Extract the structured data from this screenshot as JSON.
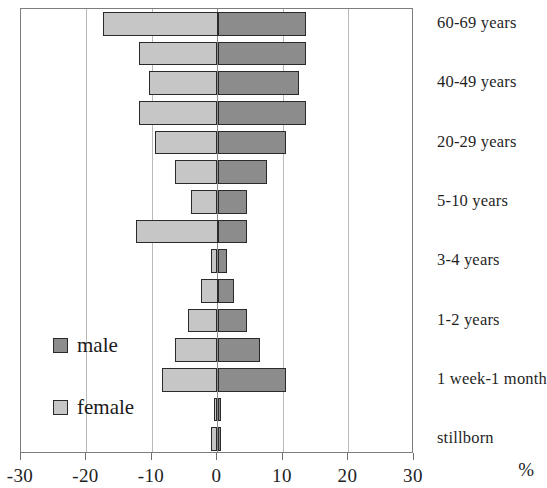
{
  "chart_data": {
    "type": "bar",
    "subtype": "population-pyramid",
    "title": "",
    "xlabel": "%",
    "ylabel": "",
    "xlim": [
      -30,
      30
    ],
    "xticks": [
      -30,
      -20,
      -10,
      0,
      10,
      20,
      30
    ],
    "xticklabels": [
      "-30",
      "-20",
      "-10",
      "0",
      "10",
      "20",
      "30"
    ],
    "grid": true,
    "legend_position": "left-inside",
    "categories": [
      "60-69 years",
      "",
      "40-49 years",
      "",
      "20-29 years",
      "",
      "5-10 years",
      "",
      "3-4 years",
      "",
      "1-2 years",
      "",
      "1 week-1 month",
      "",
      "stillborn"
    ],
    "series": [
      {
        "name": "female",
        "color": "#c6c6c6",
        "side": "left",
        "values": [
          -17.5,
          -12.0,
          -10.5,
          -12.0,
          -9.5,
          -6.5,
          -4.0,
          -12.5,
          -1.0,
          -2.5,
          -4.5,
          -6.5,
          -8.5,
          -0.5,
          -1.0
        ]
      },
      {
        "name": "male",
        "color": "#8c8c8c",
        "side": "right",
        "values": [
          13.5,
          13.5,
          12.5,
          13.5,
          10.5,
          7.5,
          4.5,
          4.5,
          1.5,
          2.5,
          4.5,
          6.5,
          10.5,
          0.5,
          0.5
        ]
      }
    ]
  },
  "axis": {
    "unit_label": "%"
  },
  "legend": {
    "items": [
      {
        "label": "male",
        "color": "#8c8c8c"
      },
      {
        "label": "female",
        "color": "#c6c6c6"
      }
    ]
  },
  "category_labels": [
    {
      "text": "60-69 years",
      "row": 0
    },
    {
      "text": "40-49 years",
      "row": 2
    },
    {
      "text": "20-29 years",
      "row": 4
    },
    {
      "text": "5-10 years",
      "row": 6
    },
    {
      "text": "3-4 years",
      "row": 8
    },
    {
      "text": "1-2 years",
      "row": 10
    },
    {
      "text": "1 week-1 month",
      "row": 12
    },
    {
      "text": "stillborn",
      "row": 14
    }
  ],
  "colors": {
    "male": "#8c8c8c",
    "female": "#c6c6c6",
    "grid": "#b9b9b9",
    "frame": "#7d7d7d",
    "bar_outline": "#2a2a2a"
  }
}
